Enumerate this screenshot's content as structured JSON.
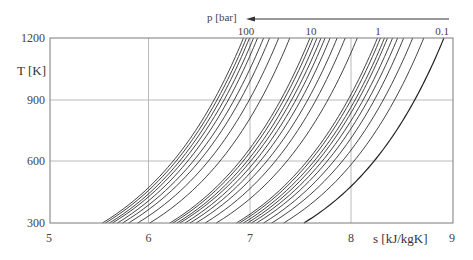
{
  "chart_data": {
    "type": "line",
    "title": "",
    "xlabel": "s [kJ/kgK]",
    "ylabel": "T [K]",
    "xlim": [
      5,
      9
    ],
    "ylim": [
      300,
      1200
    ],
    "x_ticks": [
      "5",
      "6",
      "7",
      "8",
      "9"
    ],
    "y_ticks": [
      "300",
      "600",
      "900",
      "1200"
    ],
    "grid": true,
    "pressure_axis": {
      "label": "p [bar]",
      "direction_arrow": "right-to-left",
      "labels": [
        "100",
        "10",
        "1",
        "0.1"
      ]
    },
    "isobar_model": "s = s0 + cp*ln(T/300), cp ≈ 1.0 kJ/kgK",
    "series": [
      {
        "name": "100 bar",
        "p": 100,
        "s_at_300K": 5.52,
        "s_at_1200K": 6.92
      },
      {
        "name": "90 bar",
        "p": 90,
        "s_at_300K": 5.55,
        "s_at_1200K": 6.95
      },
      {
        "name": "80 bar",
        "p": 80,
        "s_at_300K": 5.59,
        "s_at_1200K": 6.98
      },
      {
        "name": "70 bar",
        "p": 70,
        "s_at_300K": 5.62,
        "s_at_1200K": 7.02
      },
      {
        "name": "60 bar",
        "p": 60,
        "s_at_300K": 5.67,
        "s_at_1200K": 7.06
      },
      {
        "name": "50 bar",
        "p": 50,
        "s_at_300K": 5.72,
        "s_at_1200K": 7.12
      },
      {
        "name": "40 bar",
        "p": 40,
        "s_at_300K": 5.78,
        "s_at_1200K": 7.18
      },
      {
        "name": "30 bar",
        "p": 30,
        "s_at_300K": 5.87,
        "s_at_1200K": 7.27
      },
      {
        "name": "20 bar",
        "p": 20,
        "s_at_300K": 5.99,
        "s_at_1200K": 7.38
      },
      {
        "name": "10 bar",
        "p": 10,
        "s_at_300K": 6.19,
        "s_at_1200K": 7.58
      },
      {
        "name": "9 bar",
        "p": 9,
        "s_at_300K": 6.22,
        "s_at_1200K": 7.61
      },
      {
        "name": "8 bar",
        "p": 8,
        "s_at_300K": 6.26,
        "s_at_1200K": 7.65
      },
      {
        "name": "7 bar",
        "p": 7,
        "s_at_300K": 6.29,
        "s_at_1200K": 7.69
      },
      {
        "name": "6 bar",
        "p": 6,
        "s_at_300K": 6.34,
        "s_at_1200K": 7.73
      },
      {
        "name": "5 bar",
        "p": 5,
        "s_at_300K": 6.39,
        "s_at_1200K": 7.78
      },
      {
        "name": "4 bar",
        "p": 4,
        "s_at_300K": 6.45,
        "s_at_1200K": 7.85
      },
      {
        "name": "3 bar",
        "p": 3,
        "s_at_300K": 6.54,
        "s_at_1200K": 7.93
      },
      {
        "name": "2 bar",
        "p": 2,
        "s_at_300K": 6.65,
        "s_at_1200K": 8.05
      },
      {
        "name": "1 bar",
        "p": 1,
        "s_at_300K": 6.85,
        "s_at_1200K": 8.25
      },
      {
        "name": "0.9 bar",
        "p": 0.9,
        "s_at_300K": 6.88,
        "s_at_1200K": 8.28
      },
      {
        "name": "0.8 bar",
        "p": 0.8,
        "s_at_300K": 6.92,
        "s_at_1200K": 8.32
      },
      {
        "name": "0.7 bar",
        "p": 0.7,
        "s_at_300K": 6.96,
        "s_at_1200K": 8.35
      },
      {
        "name": "0.6 bar",
        "p": 0.6,
        "s_at_300K": 7.0,
        "s_at_1200K": 8.4
      },
      {
        "name": "0.5 bar",
        "p": 0.5,
        "s_at_300K": 7.05,
        "s_at_1200K": 8.45
      },
      {
        "name": "0.4 bar",
        "p": 0.4,
        "s_at_300K": 7.12,
        "s_at_1200K": 8.51
      },
      {
        "name": "0.3 bar",
        "p": 0.3,
        "s_at_300K": 7.2,
        "s_at_1200K": 8.6
      },
      {
        "name": "0.2 bar",
        "p": 0.2,
        "s_at_300K": 7.32,
        "s_at_1200K": 8.71
      },
      {
        "name": "0.1 bar",
        "p": 0.1,
        "s_at_300K": 7.52,
        "s_at_1200K": 8.91
      }
    ]
  },
  "labels": {
    "y_axis_title": "T [K]",
    "x_axis_title": "s [kJ/kgK]",
    "pressure_title": "p [bar]",
    "y_ticks": {
      "t300": "300",
      "t600": "600",
      "t900": "900",
      "t1200": "1200"
    },
    "x_ticks": {
      "s5": "5",
      "s6": "6",
      "s7": "7",
      "s8": "8",
      "s9": "9"
    },
    "p_labels": {
      "p100": "100",
      "p10": "10",
      "p1": "1",
      "p01": "0.1"
    }
  },
  "colors": {
    "curve": "#222222",
    "grid": "#9a9a9a",
    "frame": "#777777"
  }
}
